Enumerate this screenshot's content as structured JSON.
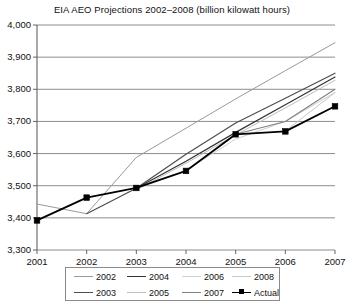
{
  "chart_data": {
    "type": "line",
    "title": "EIA AEO Projections 2002–2008 (billion kilowatt hours)",
    "xlabel": "",
    "ylabel": "",
    "x": [
      2001,
      2002,
      2003,
      2004,
      2005,
      2006,
      2007
    ],
    "xticklabels": [
      "2001",
      "2002",
      "2003",
      "2004",
      "2005",
      "2006",
      "2007"
    ],
    "yticks": [
      3300,
      3400,
      3500,
      3600,
      3700,
      3800,
      3900,
      4000
    ],
    "yticklabels": [
      "3,300",
      "3,400",
      "3,500",
      "3,600",
      "3,700",
      "3,800",
      "3,900",
      "4,000"
    ],
    "ylim": [
      3300,
      4000
    ],
    "xlim": [
      2001,
      2007
    ],
    "grid": "horizontal",
    "legend_position": "below",
    "series": [
      {
        "name": "2002",
        "color": "#9a9a9a",
        "width": 1,
        "marker": "none",
        "x": [
          2001,
          2002,
          2003,
          2004,
          2005,
          2006,
          2007
        ],
        "values": [
          3443,
          3413,
          3588,
          3679,
          3770,
          3858,
          3945
        ]
      },
      {
        "name": "2003",
        "color": "#4d4d4d",
        "width": 1.2,
        "marker": "none",
        "x": [
          2002,
          2003,
          2004,
          2005,
          2006,
          2007
        ],
        "values": [
          3413,
          3492,
          3598,
          3695,
          3772,
          3850
        ]
      },
      {
        "name": "2004",
        "color": "#333333",
        "width": 1.2,
        "marker": "none",
        "x": [
          2003,
          2004,
          2005,
          2006,
          2007
        ],
        "values": [
          3492,
          3576,
          3666,
          3752,
          3838
        ]
      },
      {
        "name": "2005",
        "color": "#bdbdbd",
        "width": 1,
        "marker": "none",
        "x": [
          2003,
          2004,
          2005,
          2006,
          2007
        ],
        "values": [
          3487,
          3570,
          3658,
          3742,
          3828
        ]
      },
      {
        "name": "2006",
        "color": "#d0d0d0",
        "width": 1,
        "marker": "none",
        "x": [
          2004,
          2005,
          2006,
          2007
        ],
        "values": [
          3548,
          3645,
          3700,
          3790
        ]
      },
      {
        "name": "2007",
        "color": "#808080",
        "width": 1.1,
        "marker": "none",
        "x": [
          2005,
          2006,
          2007
        ],
        "values": [
          3660,
          3700,
          3800
        ]
      },
      {
        "name": "2008",
        "color": "#c7c7c7",
        "width": 1,
        "marker": "none",
        "x": [
          2006,
          2007
        ],
        "values": [
          3670,
          3790
        ]
      },
      {
        "name": "Actual",
        "color": "#000000",
        "width": 1.8,
        "marker": "square",
        "x": [
          2001,
          2002,
          2003,
          2004,
          2005,
          2006,
          2007
        ],
        "values": [
          3392,
          3463,
          3493,
          3546,
          3660,
          3669,
          3747
        ]
      }
    ]
  },
  "legend": {
    "rows": [
      [
        {
          "label": "2002",
          "color": "#9a9a9a",
          "marker": false
        },
        {
          "label": "2004",
          "color": "#333333",
          "marker": false
        },
        {
          "label": "2006",
          "color": "#d0d0d0",
          "marker": false
        },
        {
          "label": "2008",
          "color": "#c7c7c7",
          "marker": false
        }
      ],
      [
        {
          "label": "2003",
          "color": "#4d4d4d",
          "marker": false
        },
        {
          "label": "2005",
          "color": "#bdbdbd",
          "marker": false
        },
        {
          "label": "2007",
          "color": "#808080",
          "marker": false
        },
        {
          "label": "Actual",
          "color": "#000000",
          "marker": true
        }
      ]
    ]
  },
  "axis": {
    "line_color": "#555555",
    "grid_color": "#707070"
  }
}
